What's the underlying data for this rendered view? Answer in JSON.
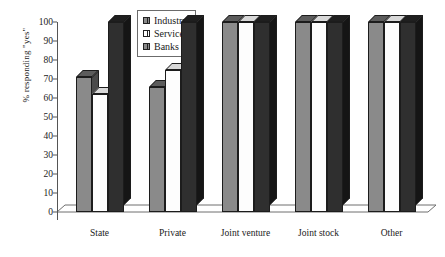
{
  "chart_data": {
    "type": "bar",
    "title": "",
    "xlabel": "",
    "ylabel": "% responding \"yes\"",
    "categories": [
      "State",
      "Private",
      "Joint venture",
      "Joint stock",
      "Other"
    ],
    "series": [
      {
        "name": "Industry",
        "color": "#8a8a8a",
        "values": [
          71,
          66,
          100,
          100,
          100
        ]
      },
      {
        "name": "Services",
        "color": "#ffffff",
        "values": [
          62,
          75,
          100,
          100,
          100
        ]
      },
      {
        "name": "Banks",
        "color": "#2f2f2f",
        "values": [
          100,
          100,
          100,
          100,
          100
        ]
      }
    ],
    "ylim": [
      0,
      100
    ],
    "yticks": [
      0,
      10,
      20,
      30,
      40,
      50,
      60,
      70,
      80,
      90,
      100
    ],
    "ytick_labels": [
      "0",
      "10",
      "20",
      "30",
      "40",
      "50",
      "60",
      "70",
      "80",
      "90",
      "100"
    ],
    "grid": false,
    "legend_position": "top-center",
    "legend_entries": [
      "Industry",
      "Services",
      "Banks"
    ],
    "style": "3d-column"
  },
  "legend": {
    "items": [
      {
        "label": "Industry",
        "swatch": "industry-swatch-icon"
      },
      {
        "label": "Services",
        "swatch": "services-swatch-icon"
      },
      {
        "label": "Banks",
        "swatch": "banks-swatch-icon"
      }
    ]
  }
}
